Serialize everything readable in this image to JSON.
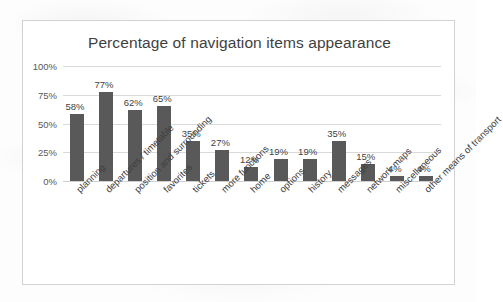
{
  "chart_data": {
    "type": "bar",
    "title": "Percentage of navigation items appearance",
    "xlabel": "",
    "ylabel": "",
    "ylim": [
      0,
      100
    ],
    "grid": true,
    "legend": "none",
    "orientation": "vertical",
    "bar_color": "#595959",
    "gridline_color": "#d9d9d9",
    "border_color": "#d2d2d2",
    "background_color": "#ffffff",
    "xtick_rotation": -45,
    "ytick_labels": [
      "0%",
      "25%",
      "50%",
      "75%",
      "100%"
    ],
    "ytick_values": [
      0,
      25,
      50,
      75,
      100
    ],
    "categories": [
      "planning",
      "departures / timetable",
      "position and surrounding",
      "favorites",
      "tickets",
      "more functions",
      "home",
      "options",
      "history",
      "messages",
      "network maps",
      "miscellaneous",
      "other means of transport"
    ],
    "values": [
      58,
      77,
      62,
      65,
      35,
      27,
      12,
      19,
      19,
      35,
      15,
      4,
      4
    ],
    "value_labels": [
      "58%",
      "77%",
      "62%",
      "65%",
      "35%",
      "27%",
      "12%",
      "19%",
      "19%",
      "35%",
      "15%",
      "4%",
      "4%"
    ]
  }
}
